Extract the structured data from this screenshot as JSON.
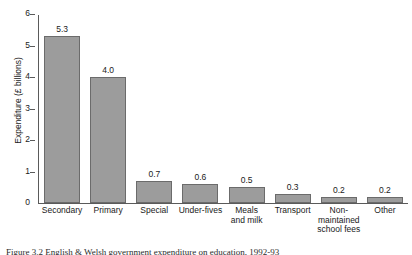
{
  "chart_data": {
    "type": "bar",
    "title": "",
    "xlabel": "",
    "ylabel": "Expenditure (£ billions)",
    "ylim": [
      0,
      6
    ],
    "yticks": [
      "0",
      "1",
      "2",
      "3",
      "4",
      "5",
      "6"
    ],
    "grid": false,
    "legend": "none",
    "bar_color": "#9c9c9c",
    "bar_edge_color": "#6b6b6b",
    "axis_color": "#5a5a5a",
    "categories": [
      "Secondary",
      "Primary",
      "Special",
      "Under-fives",
      "Meals\nand milk",
      "Transport",
      "Non-\nmaintained\nschool fees",
      "Other"
    ],
    "values": [
      5.3,
      4.0,
      0.7,
      0.6,
      0.5,
      0.3,
      0.2,
      0.2
    ],
    "data_labels": [
      "5.3",
      "4.0",
      "0.7",
      "0.6",
      "0.5",
      "0.3",
      "0.2",
      "0.2"
    ]
  },
  "axis": {
    "y_title": "Expenditure (£ billions)",
    "ticks": [
      {
        "label": "6",
        "value": 6
      },
      {
        "label": "5",
        "value": 5
      },
      {
        "label": "4",
        "value": 4
      },
      {
        "label": "3",
        "value": 3
      },
      {
        "label": "2",
        "value": 2
      },
      {
        "label": "1",
        "value": 1
      },
      {
        "label": "0",
        "value": 0
      }
    ]
  },
  "categories": [
    {
      "label": "Secondary",
      "lines": [
        "Secondary"
      ]
    },
    {
      "label": "Primary",
      "lines": [
        "Primary"
      ]
    },
    {
      "label": "Special",
      "lines": [
        "Special"
      ]
    },
    {
      "label": "Under-fives",
      "lines": [
        "Under-fives"
      ]
    },
    {
      "label": "Meals and milk",
      "lines": [
        "Meals",
        "and milk"
      ]
    },
    {
      "label": "Transport",
      "lines": [
        "Transport"
      ]
    },
    {
      "label": "Non-maintained school fees",
      "lines": [
        "Non-",
        "maintained",
        "school fees"
      ]
    },
    {
      "label": "Other",
      "lines": [
        "Other"
      ]
    }
  ],
  "caption": {
    "text": "Figure 3.2  English & Welsh government expenditure on education, 1992-93"
  }
}
